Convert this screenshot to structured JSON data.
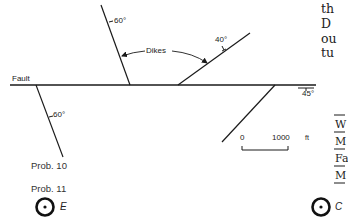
{
  "figure": {
    "fault_label": "Fault",
    "dikes_label": "Dikes",
    "dips": {
      "upper_dike": "60°",
      "middle_dike": "40°",
      "fault_east": "45°",
      "fault_branch": "60°"
    },
    "scale_bar": {
      "start": "0",
      "end": "1000",
      "unit": "ft"
    },
    "problems": {
      "prob10": "Prob. 10",
      "prob11": "Prob. 11"
    },
    "symbols": {
      "left_symbol_label": "E",
      "right_symbol_label": "C"
    }
  },
  "right_margin_text": {
    "lines": [
      "th",
      "D",
      "ou",
      "tu"
    ]
  },
  "right_margin_table": {
    "rows": [
      "W",
      "M",
      "Fa",
      "M"
    ]
  },
  "colors": {
    "ink": "#1a1a1a",
    "background": "#ffffff"
  }
}
